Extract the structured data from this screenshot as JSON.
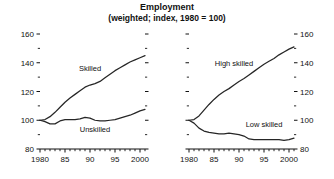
{
  "header": {
    "title": "Employment",
    "subtitle": "(weighted; index, 1980 = 100)"
  },
  "chart_data": [
    {
      "type": "line",
      "panel": "left",
      "title": "Employment",
      "subtitle": "(weighted; index, 1980 = 100)",
      "xlabel": "",
      "ylabel": "",
      "xlim": [
        1980,
        2001
      ],
      "ylim": [
        80,
        160
      ],
      "yticks": [
        80,
        100,
        120,
        140,
        160
      ],
      "yticklabels": [
        "80",
        "100",
        "120",
        "140",
        "160"
      ],
      "yminorticks": [
        90,
        110,
        130,
        150
      ],
      "xticks": [
        1980,
        1985,
        1990,
        1995,
        2000
      ],
      "xticklabels": [
        "1980",
        "85",
        "90",
        "95",
        "2000"
      ],
      "grid": false,
      "legend_position": "inline-annotation",
      "x": [
        1980,
        1981,
        1982,
        1983,
        1984,
        1985,
        1986,
        1987,
        1988,
        1989,
        1990,
        1991,
        1992,
        1993,
        1994,
        1995,
        1996,
        1997,
        1998,
        1999,
        2000,
        2001
      ],
      "series": [
        {
          "name": "Skilled",
          "values": [
            100,
            100.5,
            102.5,
            105.5,
            109,
            112.5,
            115.5,
            118,
            120.5,
            123,
            124.5,
            125.5,
            127,
            129.5,
            132,
            134.5,
            136.5,
            138.5,
            140.5,
            142,
            143.5,
            145
          ]
        },
        {
          "name": "Unskilled",
          "values": [
            100,
            99,
            97.5,
            97.5,
            99.5,
            100.5,
            100.5,
            100.5,
            101,
            102,
            101.5,
            100,
            99.5,
            99.5,
            100,
            100.5,
            101.5,
            102.5,
            103.5,
            105,
            106.5,
            107.5
          ]
        }
      ],
      "annotations": [
        {
          "text": "Skilled",
          "x": 1990,
          "y": 134
        },
        {
          "text": "Unskilled",
          "x": 1991,
          "y": 92
        }
      ]
    },
    {
      "type": "line",
      "panel": "right",
      "title": "Employment",
      "subtitle": "(weighted; index, 1980 = 100)",
      "xlabel": "",
      "ylabel": "",
      "xlim": [
        1980,
        2001
      ],
      "ylim": [
        80,
        160
      ],
      "yticks": [
        80,
        100,
        120,
        140,
        160
      ],
      "yticklabels": [
        "80",
        "100",
        "120",
        "140",
        "160"
      ],
      "yminorticks": [
        90,
        110,
        130,
        150
      ],
      "xticks": [
        1980,
        1985,
        1990,
        1995,
        2000
      ],
      "xticklabels": [
        "1980",
        "85",
        "90",
        "95",
        "2000"
      ],
      "grid": false,
      "legend_position": "inline-annotation",
      "x": [
        1980,
        1981,
        1982,
        1983,
        1984,
        1985,
        1986,
        1987,
        1988,
        1989,
        1990,
        1991,
        1992,
        1993,
        1994,
        1995,
        1996,
        1997,
        1998,
        1999,
        2000,
        2001
      ],
      "series": [
        {
          "name": "High skilled",
          "values": [
            100,
            100.5,
            103,
            107,
            111,
            114.5,
            117.5,
            120,
            122,
            124.5,
            127,
            129,
            131.5,
            134,
            136.5,
            139,
            141,
            143,
            145.5,
            147.5,
            149.5,
            151
          ]
        },
        {
          "name": "Low skilled",
          "values": [
            100,
            98,
            94.5,
            92.5,
            91.5,
            91,
            90.5,
            90.5,
            91,
            90.5,
            90,
            89,
            87,
            86.5,
            86.5,
            86.5,
            86.5,
            86.5,
            86.5,
            86,
            86.5,
            87.5
          ]
        }
      ],
      "annotations": [
        {
          "text": "High skilled",
          "x": 1989,
          "y": 138
        },
        {
          "text": "Low skilled",
          "x": 1995,
          "y": 95
        }
      ]
    }
  ],
  "colors": {
    "line": "#262626",
    "axis": "#111111",
    "text": "#111111",
    "background": "#ffffff"
  }
}
